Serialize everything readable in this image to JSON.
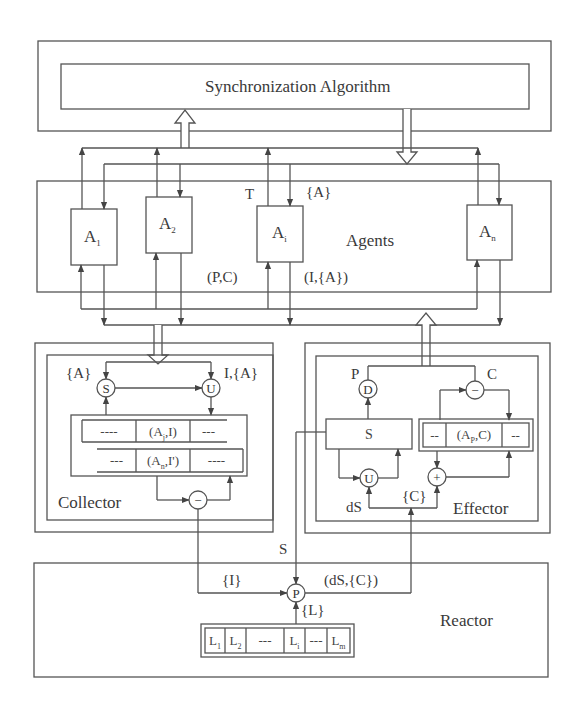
{
  "diagram": {
    "sync": {
      "title": "Synchronization Algorithm"
    },
    "agents": {
      "label": "Agents",
      "boxes": [
        {
          "base": "A",
          "sub": "1"
        },
        {
          "base": "A",
          "sub": "2"
        },
        {
          "base": "A",
          "sub": "i"
        },
        {
          "base": "A",
          "sub": "n"
        }
      ],
      "label_T": "T",
      "label_A_set": "{A}",
      "label_PC": "(P,C)",
      "label_IA": "(I,{A})"
    },
    "collector": {
      "label": "Collector",
      "label_A_set": "{A}",
      "label_IA": "I,{A}",
      "op_S": "S",
      "op_U": "U",
      "op_minus": "−",
      "rows": [
        {
          "left": "----",
          "mid_base": "(A",
          "mid_sub": "j",
          "mid_tail": ",I)",
          "right": "---"
        },
        {
          "left": "---",
          "mid_base": "(A",
          "mid_sub": "n",
          "mid_tail": ",I')",
          "right": "----"
        }
      ]
    },
    "effector": {
      "label": "Effector",
      "label_P": "P",
      "label_C": "C",
      "label_dS": "dS",
      "label_C_set": "{C}",
      "op_D": "D",
      "op_minus": "−",
      "op_U": "U",
      "op_plus": "+",
      "s_box": "S",
      "table": {
        "left": "--",
        "mid_base": "(A",
        "mid_sub": "P",
        "mid_tail": ",C)",
        "right": "--"
      }
    },
    "between": {
      "label_S": "S"
    },
    "reactor": {
      "label": "Reactor",
      "op_P": "P",
      "label_I_set": "{I}",
      "label_dSC": "(dS,{C})",
      "label_L_set": "{L}",
      "cells": [
        {
          "base": "L",
          "sub": "1"
        },
        {
          "base": "L",
          "sub": "2"
        },
        {
          "base": "---",
          "sub": ""
        },
        {
          "base": "L",
          "sub": "i"
        },
        {
          "base": "---",
          "sub": ""
        },
        {
          "base": "L",
          "sub": "m"
        }
      ]
    }
  }
}
